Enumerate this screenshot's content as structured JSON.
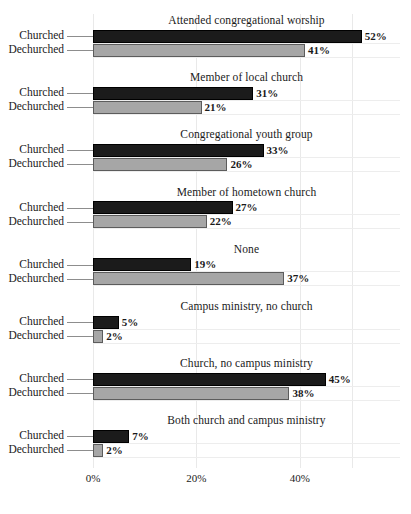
{
  "chart_data": {
    "type": "bar",
    "orientation": "horizontal",
    "title": "",
    "xlabel": "",
    "ylabel": "",
    "xlim": [
      0,
      59.5
    ],
    "grid": true,
    "legend_position": "none",
    "series": [
      {
        "name": "Churched",
        "color": "#1b1b1b"
      },
      {
        "name": "Dechurched",
        "color": "#a6a6a6"
      }
    ],
    "categories": [
      "Attended congregational worship",
      "Member of local church",
      "Congregational youth group",
      "Member of hometown church",
      "None",
      "Campus ministry, no church",
      "Church, no campus ministry",
      "Both church and campus ministry"
    ],
    "panels": [
      {
        "title": "Attended congregational worship",
        "rows": [
          {
            "label": "Churched",
            "value": 52,
            "value_label": "52%"
          },
          {
            "label": "Dechurched",
            "value": 41,
            "value_label": "41%"
          }
        ]
      },
      {
        "title": "Member of local church",
        "rows": [
          {
            "label": "Churched",
            "value": 31,
            "value_label": "31%"
          },
          {
            "label": "Dechurched",
            "value": 21,
            "value_label": "21%"
          }
        ]
      },
      {
        "title": "Congregational youth group",
        "rows": [
          {
            "label": "Churched",
            "value": 33,
            "value_label": "33%"
          },
          {
            "label": "Dechurched",
            "value": 26,
            "value_label": "26%"
          }
        ]
      },
      {
        "title": "Member of hometown church",
        "rows": [
          {
            "label": "Churched",
            "value": 27,
            "value_label": "27%"
          },
          {
            "label": "Dechurched",
            "value": 22,
            "value_label": "22%"
          }
        ]
      },
      {
        "title": "None",
        "rows": [
          {
            "label": "Churched",
            "value": 19,
            "value_label": "19%"
          },
          {
            "label": "Dechurched",
            "value": 37,
            "value_label": "37%"
          }
        ]
      },
      {
        "title": "Campus ministry, no church",
        "rows": [
          {
            "label": "Churched",
            "value": 5,
            "value_label": "5%"
          },
          {
            "label": "Dechurched",
            "value": 2,
            "value_label": "2%"
          }
        ]
      },
      {
        "title": "Church, no campus ministry",
        "rows": [
          {
            "label": "Churched",
            "value": 45,
            "value_label": "45%"
          },
          {
            "label": "Dechurched",
            "value": 38,
            "value_label": "38%"
          }
        ]
      },
      {
        "title": "Both church and campus ministry",
        "rows": [
          {
            "label": "Churched",
            "value": 7,
            "value_label": "7%"
          },
          {
            "label": "Dechurched",
            "value": 2,
            "value_label": "2%"
          }
        ]
      }
    ],
    "xticks": [
      0,
      20,
      40
    ],
    "xtick_labels": [
      "0%",
      "20%",
      "40%"
    ]
  },
  "colors": {
    "churched": "#1b1b1b",
    "dechurched": "#a6a6a6",
    "grid": "#ededed",
    "background": "#ffffff",
    "text": "#1a1a1a"
  }
}
